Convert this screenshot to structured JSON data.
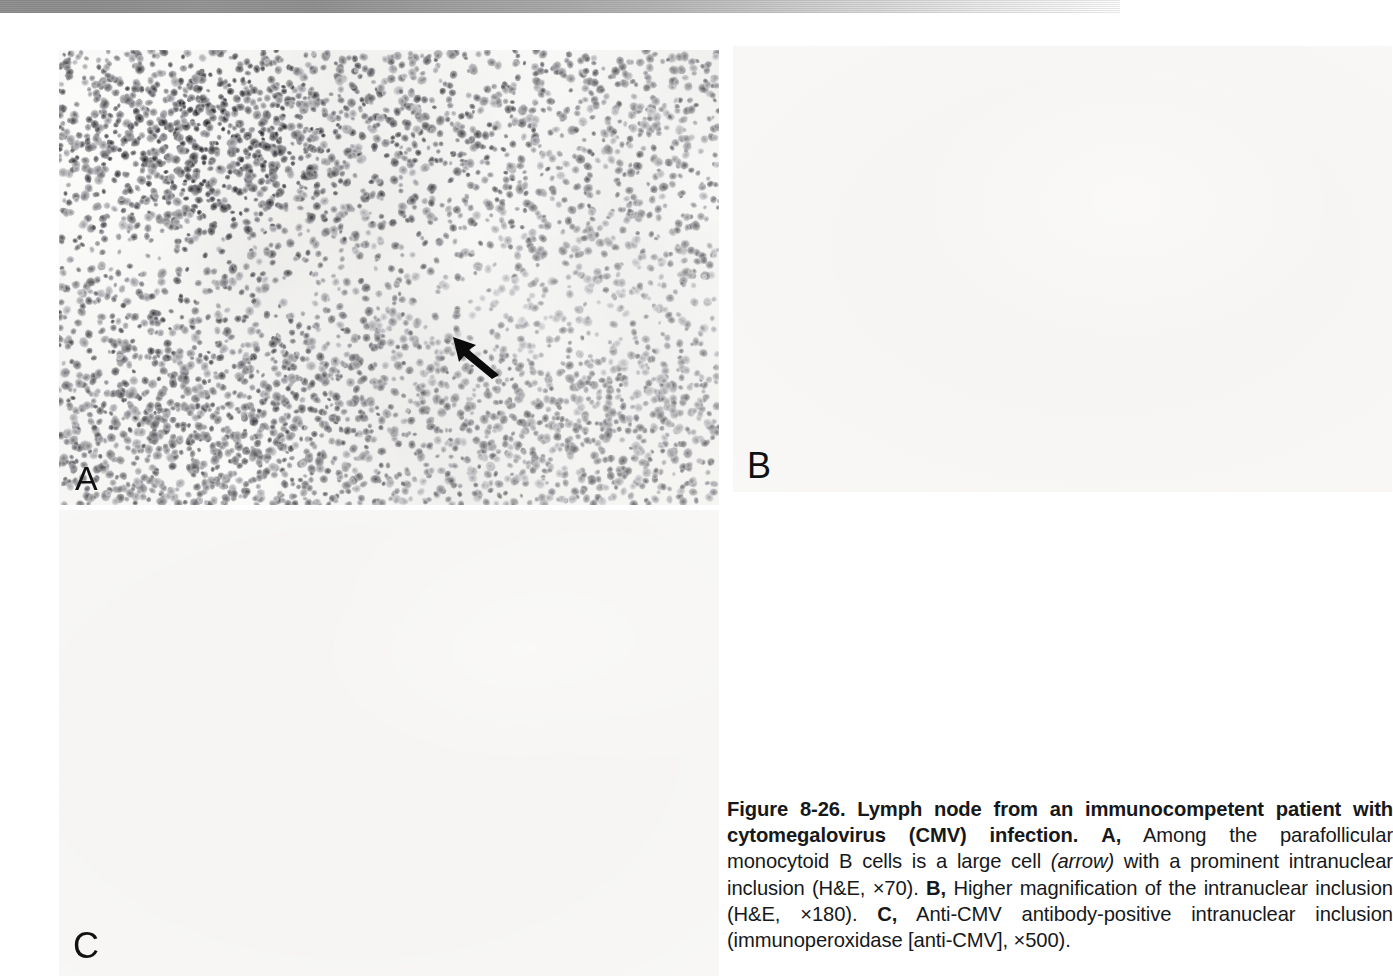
{
  "figure": {
    "number": "Figure 8-26.",
    "title": "Lymph node from an immunocompetent patient with cytomegalovirus (CMV) infection.",
    "panels": [
      {
        "id": "A",
        "label": "A",
        "marker": "A,",
        "description": "Among the parafollicular monocytoid B cells is a large cell",
        "emphasis": "(arrow)",
        "description_after": "with a prominent intranuclear inclusion (H&E, ×70).",
        "stain": "H&E",
        "magnification": "×70",
        "has_arrow": true
      },
      {
        "id": "B",
        "label": "B",
        "marker": "B,",
        "description": "Higher magnification of the intranuclear inclusion (H&E, ×180).",
        "stain": "H&E",
        "magnification": "×180",
        "has_arrow": false
      },
      {
        "id": "C",
        "label": "C",
        "marker": "C,",
        "description": "Anti-CMV antibody-positive intranuclear inclusion (immunoperoxidase [anti-CMV], ×500).",
        "stain": "immunoperoxidase [anti-CMV]",
        "magnification": "×500",
        "has_arrow": false
      }
    ],
    "caption_segments": {
      "fig_number": "Figure 8-26.",
      "bold_title": "Lymph node from an immunocompetent patient with cytomegalovirus (CMV) infection.",
      "a_marker": "A,",
      "a_text_1": "Among the parafollicular monocytoid B cells is a large cell",
      "a_italic": "(arrow)",
      "a_text_2": "with a prominent intranuclear inclusion (H&E, ×70).",
      "b_marker": "B,",
      "b_text": "Higher magnification of the intranuclear inclusion (H&E, ×180).",
      "c_marker": "C,",
      "c_text": "Anti-CMV antibody-positive intranuclear inclusion (immunoperoxidase [anti-CMV], ×500)."
    }
  },
  "colors": {
    "page_background": "#ffffff",
    "caption_text": "#16181a",
    "panel_label": "#111111",
    "arrow": "#0b0b0b",
    "scan_band_dark": "#8e8e8e",
    "scan_band_light": "#ffffff",
    "nuclei_dark": "#4a4a4a",
    "tissue_pale": "#f2f1ee"
  },
  "render": {
    "width": 1392,
    "height": 976
  }
}
